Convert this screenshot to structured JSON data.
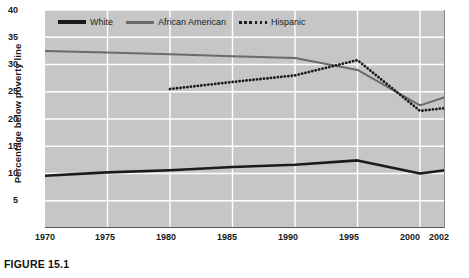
{
  "figure": {
    "caption": "FIGURE 15.1"
  },
  "chart_data": {
    "type": "line",
    "title": "",
    "xlabel": "",
    "ylabel": "Percentage below poverty line",
    "xlim": [
      1970,
      2002
    ],
    "ylim": [
      0,
      40
    ],
    "grid": true,
    "legend_position": "top-left-inside",
    "ytick_labels": [
      "40",
      "35",
      "30",
      "25",
      "20",
      "15",
      "10",
      "5"
    ],
    "ytick_values": [
      40,
      35,
      30,
      25,
      20,
      15,
      10,
      5
    ],
    "xtick_labels": [
      "1970",
      "1975",
      "1980",
      "1985",
      "1990",
      "1995",
      "2000",
      "2002"
    ],
    "xtick_values": [
      1970,
      1975,
      1980,
      1985,
      1990,
      1995,
      2000,
      2002
    ],
    "series": [
      {
        "name": "White",
        "style": "solid-thick",
        "color": "#1b1b1b",
        "x": [
          1970,
          1975,
          1980,
          1985,
          1990,
          1995,
          2000,
          2002
        ],
        "values": [
          9.6,
          10.2,
          10.6,
          11.2,
          11.6,
          12.4,
          10.0,
          10.6
        ]
      },
      {
        "name": "African American",
        "style": "solid-medium",
        "color": "#6a6a6a",
        "x": [
          1970,
          1975,
          1980,
          1985,
          1990,
          1995,
          2000,
          2002
        ],
        "values": [
          32.5,
          32.2,
          31.9,
          31.5,
          31.2,
          29.0,
          22.5,
          24.0
        ]
      },
      {
        "name": "Hispanic",
        "style": "dotted",
        "color": "#1b1b1b",
        "x": [
          1980,
          1985,
          1990,
          1995,
          2000,
          2002
        ],
        "values": [
          25.5,
          26.8,
          28.0,
          30.8,
          21.5,
          22.0
        ]
      }
    ]
  },
  "legend": {
    "items": [
      {
        "label": "White",
        "swatch": "solid-thick-black-line"
      },
      {
        "label": "African American",
        "swatch": "solid-gray-line"
      },
      {
        "label": "Hispanic",
        "swatch": "dotted-black-line"
      }
    ]
  }
}
